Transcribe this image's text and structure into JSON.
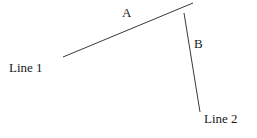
{
  "figure": {
    "background_color": "#ffffff",
    "stroke_color": "#3a3a3a",
    "text_color": "#1a1a1a",
    "width": 257,
    "height": 138,
    "segments": [
      {
        "id": "segment-a",
        "label": "A",
        "x1": 63,
        "y1": 57,
        "x2": 193,
        "y2": 3,
        "stroke_width": 1
      },
      {
        "id": "segment-b",
        "label": "B",
        "x1": 184,
        "y1": 13,
        "x2": 200,
        "y2": 112,
        "stroke_width": 1
      }
    ],
    "labels": {
      "segment_a": "A",
      "segment_b": "B",
      "line_1": "Line 1",
      "line_2": "Line 2"
    }
  }
}
